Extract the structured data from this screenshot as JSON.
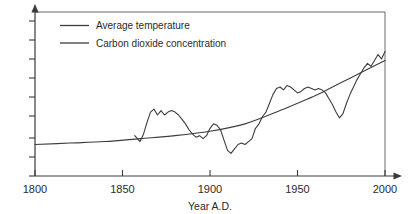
{
  "chart_data": {
    "type": "line",
    "title": "",
    "xlabel": "Year A.D.",
    "ylabel": "",
    "xlim": [
      1800,
      2000
    ],
    "grid": false,
    "legend_position": "top-left",
    "xticks": [
      "1800",
      "1850",
      "1900",
      "1950",
      "2000"
    ],
    "xtick_values": [
      1800,
      1850,
      1900,
      1950,
      2000
    ],
    "yticks": [],
    "ytick_count": 9,
    "series": [
      {
        "name": "Average temperature",
        "color": "#3d3d3d",
        "x": [
          1857,
          1860,
          1862,
          1864,
          1866,
          1868,
          1870,
          1872,
          1874,
          1876,
          1878,
          1880,
          1882,
          1884,
          1886,
          1888,
          1890,
          1892,
          1894,
          1896,
          1898,
          1900,
          1902,
          1904,
          1906,
          1908,
          1910,
          1912,
          1914,
          1916,
          1918,
          1920,
          1922,
          1924,
          1926,
          1928,
          1930,
          1932,
          1934,
          1936,
          1938,
          1940,
          1942,
          1944,
          1946,
          1948,
          1950,
          1952,
          1954,
          1956,
          1958,
          1960,
          1962,
          1964,
          1966,
          1968,
          1970,
          1972,
          1974,
          1976,
          1978,
          1980,
          1982,
          1984,
          1986,
          1988,
          1990,
          1992,
          1994,
          1996,
          1998,
          2000
        ],
        "y": [
          -0.22,
          -0.3,
          -0.2,
          -0.04,
          0.1,
          0.14,
          0.06,
          0.12,
          0.06,
          0.1,
          0.12,
          0.1,
          0.06,
          0.0,
          -0.06,
          -0.14,
          -0.2,
          -0.24,
          -0.22,
          -0.26,
          -0.22,
          -0.12,
          -0.06,
          -0.08,
          -0.14,
          -0.28,
          -0.42,
          -0.46,
          -0.4,
          -0.34,
          -0.32,
          -0.34,
          -0.3,
          -0.26,
          -0.12,
          -0.06,
          0.04,
          0.1,
          0.22,
          0.34,
          0.42,
          0.44,
          0.4,
          0.46,
          0.44,
          0.4,
          0.36,
          0.38,
          0.42,
          0.44,
          0.42,
          0.4,
          0.42,
          0.4,
          0.36,
          0.28,
          0.2,
          0.1,
          0.02,
          0.08,
          0.22,
          0.34,
          0.44,
          0.54,
          0.62,
          0.7,
          0.76,
          0.72,
          0.8,
          0.88,
          0.82,
          0.92
        ]
      },
      {
        "name": "Carbon dioxide concentration",
        "color": "#3d3d3d",
        "x": [
          1800,
          1820,
          1840,
          1860,
          1880,
          1900,
          1920,
          1940,
          1950,
          1960,
          1970,
          1980,
          1990,
          2000
        ],
        "y": [
          -0.34,
          -0.32,
          -0.3,
          -0.26,
          -0.22,
          -0.16,
          -0.06,
          0.12,
          0.22,
          0.32,
          0.44,
          0.56,
          0.68,
          0.8
        ]
      }
    ]
  },
  "legend": {
    "entries": [
      {
        "label": "Average temperature"
      },
      {
        "label": "Carbon dioxide concentration"
      }
    ]
  },
  "axes": {
    "x_title": "Year A.D."
  }
}
